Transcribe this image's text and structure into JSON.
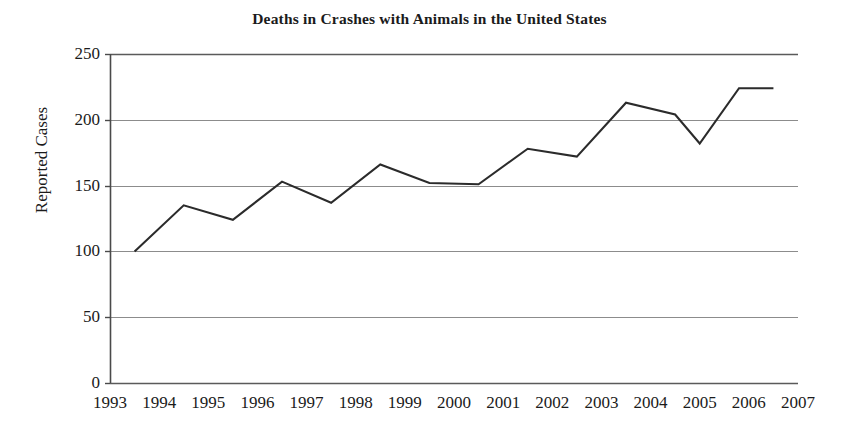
{
  "chart_data": {
    "type": "line",
    "title": "Deaths in Crashes with Animals in the United States",
    "xlabel": "",
    "ylabel": "Reported Cases",
    "x": [
      1993.5,
      1994.5,
      1995.5,
      1996.5,
      1997.5,
      1998.5,
      1999.5,
      2000.5,
      2001.5,
      2002.5,
      2003.5,
      2004.5,
      2005.0,
      2005.8,
      2006.5
    ],
    "categories": [
      "1993",
      "1994",
      "1995",
      "1996",
      "1997",
      "1998",
      "1999",
      "2000",
      "2001",
      "2002",
      "2003",
      "2004",
      "2005",
      "2006",
      "2007"
    ],
    "values": [
      100,
      135,
      124,
      153,
      137,
      166,
      152,
      151,
      178,
      172,
      213,
      204,
      182,
      224,
      224
    ],
    "series": [
      {
        "name": "Reported Cases",
        "color": "#2b2b2b",
        "values": [
          100,
          135,
          124,
          153,
          137,
          166,
          152,
          151,
          178,
          172,
          213,
          204,
          182,
          224,
          224
        ]
      }
    ],
    "xlim": [
      1993,
      2007
    ],
    "ylim": [
      0,
      250
    ],
    "xticks": [
      "1993",
      "1994",
      "1995",
      "1996",
      "1997",
      "1998",
      "1999",
      "2000",
      "2001",
      "2002",
      "2003",
      "2004",
      "2005",
      "2006",
      "2007"
    ],
    "yticks": [
      "0",
      "50",
      "100",
      "150",
      "200",
      "250"
    ],
    "ytick_values": [
      0,
      50,
      100,
      150,
      200,
      250
    ],
    "grid": "horizontal",
    "legend": "none",
    "line_color": "#2b2b2b",
    "grid_color": "#8c8c8c",
    "axis_color": "#4a4a4a"
  }
}
